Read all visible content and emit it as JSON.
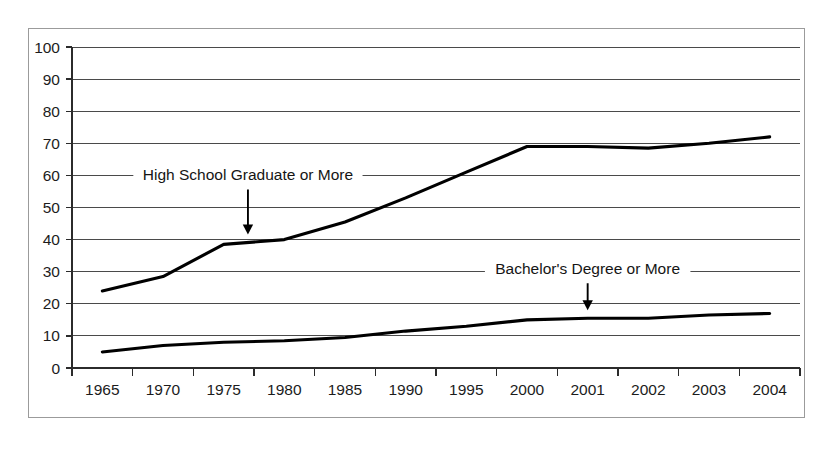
{
  "chart_data": {
    "type": "line",
    "title": "",
    "subtitle": "",
    "xlabel": "",
    "ylabel": "",
    "categories": [
      "1965",
      "1970",
      "1975",
      "1980",
      "1985",
      "1990",
      "1995",
      "2000",
      "2001",
      "2002",
      "2003",
      "2004"
    ],
    "ylim": [
      0,
      100
    ],
    "y_ticks": [
      "0",
      "10",
      "20",
      "30",
      "40",
      "50",
      "60",
      "70",
      "80",
      "90",
      "100"
    ],
    "y_tick_values": [
      0,
      10,
      20,
      30,
      40,
      50,
      60,
      70,
      80,
      90,
      100
    ],
    "grid": "horizontal",
    "legend_position": "none",
    "series": [
      {
        "name": "High School Graduate or More",
        "color": "#000000",
        "values": [
          24,
          28.5,
          38.5,
          40,
          45.5,
          53,
          61,
          69,
          69,
          68.5,
          70,
          72
        ]
      },
      {
        "name": "Bachelor's Degree or More",
        "color": "#000000",
        "values": [
          5,
          7,
          8,
          8.5,
          9.5,
          11.5,
          13,
          15,
          15.5,
          15.5,
          16.5,
          17
        ]
      }
    ],
    "annotations": [
      {
        "id": "hs-annotation",
        "text": "High School Graduate or More",
        "points_to_series": "High School Graduate or More",
        "points_to_category": "1977",
        "arrow_direction": "down"
      },
      {
        "id": "bachelors-annotation",
        "text": "Bachelor's Degree or More",
        "points_to_series": "Bachelor's Degree or More",
        "points_to_category": "2001",
        "arrow_direction": "down"
      }
    ]
  },
  "figure": {
    "frame_color": "#9b9b9b",
    "background_color": "#ffffff",
    "line_color": "#000000",
    "gridline_color": "#4a4a4a"
  }
}
